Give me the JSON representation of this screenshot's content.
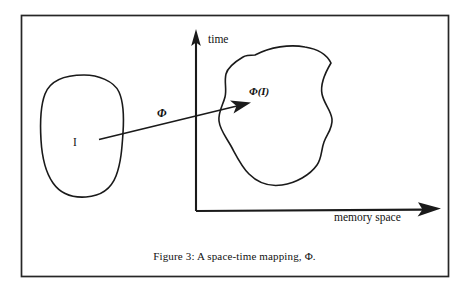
{
  "figure": {
    "caption": "Figure 3: A space-time mapping, Φ.",
    "frame": {
      "x": 21,
      "y": 15,
      "width": 428,
      "height": 262,
      "color": "#262626"
    },
    "axes": {
      "origin_x": 196,
      "origin_y": 211,
      "y_axis_top": 30,
      "x_axis_right": 440,
      "y_label": "time",
      "x_label": "memory space",
      "color": "#1a1a1a"
    },
    "source_set": {
      "label": "I",
      "label_x": 76,
      "label_y": 142,
      "description": "rounded oval region"
    },
    "image_set": {
      "label": "Φ(I)",
      "label_x": 250,
      "label_y": 94,
      "description": "irregular amoeba region"
    },
    "mapping_arrow": {
      "label": "Φ",
      "label_x": 160,
      "label_y": 116,
      "start_x": 99,
      "start_y": 139,
      "end_x": 250,
      "end_y": 103
    },
    "colors": {
      "ink": "#1a1a1a",
      "background": "#ffffff",
      "frame": "#262626"
    }
  }
}
